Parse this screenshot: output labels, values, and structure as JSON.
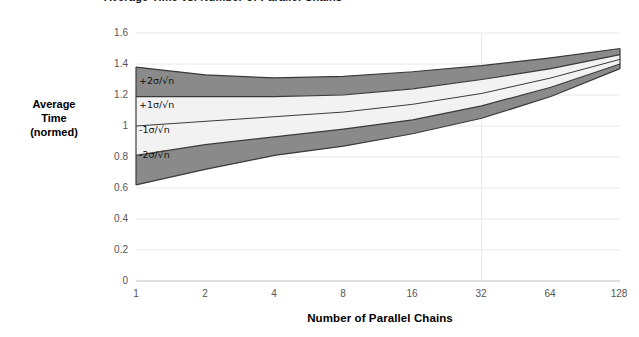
{
  "title": {
    "text": "Average Time vs. Number of Parallel Chains",
    "clipped": true
  },
  "axes": {
    "x_title": "Number of Parallel Chains",
    "y_title_line1": "Average",
    "y_title_line2": "Time",
    "y_title_line3": "(normed)",
    "y_ticks": [
      "0",
      "0.2",
      "0.4",
      "0.6",
      "0.8",
      "1",
      "1.2",
      "1.4",
      "1.6"
    ],
    "x_ticks": [
      "1",
      "2",
      "4",
      "8",
      "16",
      "32",
      "64",
      "128"
    ]
  },
  "band_labels": [
    {
      "sign": "+2",
      "sigma": "σ",
      "slash": "/",
      "radical": "√",
      "n": "n",
      "full": "+2σ/√n"
    },
    {
      "sign": "+1",
      "sigma": "σ",
      "slash": "/",
      "radical": "√",
      "n": "n",
      "full": "+1σ/√n"
    },
    {
      "sign": "-1",
      "sigma": "σ",
      "slash": "/",
      "radical": "√",
      "n": "n",
      "full": "-1σ/√n"
    },
    {
      "sign": "-2",
      "sigma": "σ",
      "slash": "/",
      "radical": "√",
      "n": "n",
      "full": "-2σ/√n"
    }
  ],
  "colors": {
    "outer_band": "#8a8a8a",
    "inner_band": "#f2f2f2",
    "stroke": "#3a3a3a",
    "gridline": "#e8e8e8",
    "axis_line": "#d9d9d9",
    "tick_text": "#555555",
    "title_text": "#000000"
  },
  "chart_data": {
    "type": "area",
    "title": "Average Time vs. Number of Parallel Chains",
    "xlabel": "Number of Parallel Chains",
    "ylabel": "Average Time (normed)",
    "xscale": "log2",
    "x": [
      1,
      2,
      4,
      8,
      16,
      32,
      64,
      128
    ],
    "xlim": [
      1,
      128
    ],
    "ylim": [
      0,
      1.6
    ],
    "yticks": [
      0,
      0.2,
      0.4,
      0.6,
      0.8,
      1.0,
      1.2,
      1.4,
      1.6
    ],
    "grid": true,
    "legend": "inline band labels at left edge",
    "series": [
      {
        "name": "+2σ/√n",
        "values": [
          1.38,
          1.33,
          1.31,
          1.32,
          1.35,
          1.39,
          1.44,
          1.5
        ]
      },
      {
        "name": "+1σ/√n",
        "values": [
          1.19,
          1.19,
          1.19,
          1.2,
          1.24,
          1.3,
          1.37,
          1.46
        ]
      },
      {
        "name": "mean",
        "values": [
          1.0,
          1.03,
          1.06,
          1.09,
          1.14,
          1.21,
          1.31,
          1.43
        ]
      },
      {
        "name": "-1σ/√n",
        "values": [
          0.81,
          0.88,
          0.93,
          0.98,
          1.04,
          1.13,
          1.25,
          1.4
        ]
      },
      {
        "name": "-2σ/√n",
        "values": [
          0.62,
          0.72,
          0.81,
          0.87,
          0.95,
          1.05,
          1.19,
          1.37
        ]
      }
    ]
  }
}
